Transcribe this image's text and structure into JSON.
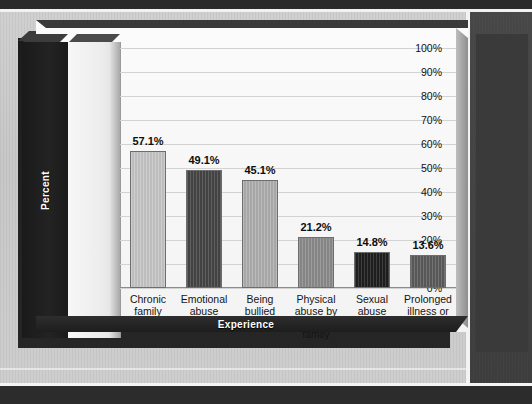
{
  "chart_data": {
    "type": "bar",
    "title": "",
    "subtitle": "",
    "xlabel": "Experience",
    "ylabel": "Percent",
    "categories": [
      "Chronic family problems",
      "Emotional abuse",
      "Being bullied",
      "Physical abuse by adult in family",
      "Sexual abuse",
      "Prolonged illness or handicap"
    ],
    "category_lines": [
      [
        "Chronic",
        "family",
        "problems"
      ],
      [
        "Emotional",
        "abuse"
      ],
      [
        "Being",
        "bullied"
      ],
      [
        "Physical",
        "abuse by",
        "adult in",
        "family"
      ],
      [
        "Sexual",
        "abuse"
      ],
      [
        "Prolonged",
        "illness or",
        "handicap"
      ]
    ],
    "values": [
      57.1,
      49.1,
      45.1,
      21.2,
      14.8,
      13.6
    ],
    "value_labels": [
      "57.1%",
      "49.1%",
      "45.1%",
      "21.2%",
      "14.8%",
      "13.6%"
    ],
    "bar_colors": [
      "#c7c7c7",
      "#464646",
      "#b0b0b0",
      "#8c8c8c",
      "#1f1f1f",
      "#5c5c5c"
    ],
    "ylim": [
      0,
      100
    ],
    "ytick_values": [
      0,
      10,
      20,
      30,
      40,
      50,
      60,
      70,
      80,
      90,
      100
    ],
    "ytick_labels": [
      "0%",
      "10%",
      "20%",
      "30%",
      "40%",
      "50%",
      "60%",
      "70%",
      "80%",
      "90%",
      "100%"
    ],
    "grid": true,
    "legend": false,
    "legend_position": "none",
    "style_3d": true
  },
  "page": {
    "background_color": "#c9c9c9",
    "frame_color": "#2a2a2a",
    "axis_band_color": "#1c1c1c",
    "plot_background": "#fbfbfb",
    "gridline_color": "#d2d2d2"
  }
}
